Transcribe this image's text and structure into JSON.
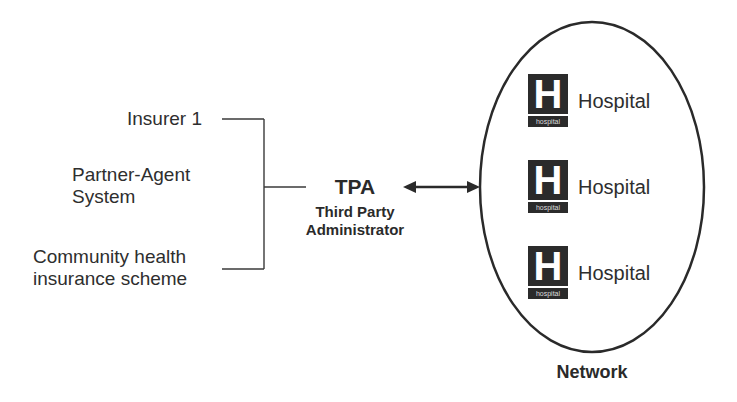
{
  "sources": [
    {
      "label_lines": [
        "Insurer 1"
      ]
    },
    {
      "label_lines": [
        "Partner-Agent",
        "System"
      ]
    },
    {
      "label_lines": [
        "Community health",
        "insurance scheme"
      ]
    }
  ],
  "tpa": {
    "abbr": "TPA",
    "full_line1": "Third Party",
    "full_line2": "Administrator"
  },
  "network": {
    "label": "Network",
    "hospitals": [
      {
        "label": "Hospital",
        "icon_letter": "H",
        "icon_caption": "hospital"
      },
      {
        "label": "Hospital",
        "icon_letter": "H",
        "icon_caption": "hospital"
      },
      {
        "label": "Hospital",
        "icon_letter": "H",
        "icon_caption": "hospital"
      }
    ]
  },
  "colors": {
    "line": "#2a2a2a",
    "icon": "#2b2b2b",
    "background": "#ffffff"
  }
}
